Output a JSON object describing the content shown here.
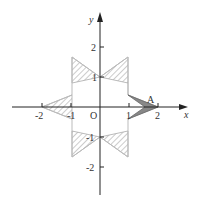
{
  "diagram": {
    "axes": {
      "x_label": "x",
      "y_label": "y",
      "origin_label": "O",
      "x_ticks": [
        "-2",
        "-1",
        "1",
        "2"
      ],
      "y_ticks": [
        "2",
        "1",
        "-1",
        "-2"
      ]
    },
    "point_label": "A",
    "shape": "six-pointed star with hatched triangular regions; one shaded triangle at point A on positive x-axis",
    "colors": {
      "axis": "#222222",
      "star_outline": "#bbbbbb",
      "hatch": "#999999",
      "shaded": "#777777"
    }
  }
}
